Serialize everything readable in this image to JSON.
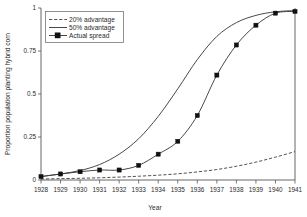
{
  "chart_data": {
    "type": "line",
    "title": "",
    "xlabel": "Year",
    "ylabel": "Proportion population planting hybrid corn",
    "x": [
      1928,
      1929,
      1930,
      1931,
      1932,
      1933,
      1934,
      1935,
      1936,
      1937,
      1938,
      1939,
      1940,
      1941
    ],
    "xlim": [
      1928,
      1941
    ],
    "ylim": [
      0,
      1
    ],
    "xticks": [
      "1928",
      "1929",
      "1930",
      "1931",
      "1932",
      "1933",
      "1934",
      "1935",
      "1936",
      "1937",
      "1938",
      "1939",
      "1940",
      "1941"
    ],
    "yticks": [
      "0",
      "0.25",
      "0.5",
      "0.75",
      "1"
    ],
    "ytick_values": [
      0,
      0.25,
      0.5,
      0.75,
      1
    ],
    "grid": false,
    "legend_position": "top-left",
    "series": [
      {
        "name": "20% advantage",
        "style": "dashed",
        "marker": "none",
        "color": "#333333",
        "values": [
          0.006,
          0.008,
          0.01,
          0.013,
          0.017,
          0.022,
          0.028,
          0.036,
          0.047,
          0.061,
          0.08,
          0.104,
          0.133,
          0.165
        ]
      },
      {
        "name": "50% advantage",
        "style": "solid",
        "marker": "none",
        "color": "#333333",
        "values": [
          0.02,
          0.035,
          0.055,
          0.09,
          0.15,
          0.24,
          0.37,
          0.53,
          0.7,
          0.835,
          0.915,
          0.957,
          0.978,
          0.985
        ]
      },
      {
        "name": "Actual spread",
        "style": "solid",
        "marker": "square",
        "color": "#111111",
        "values": [
          0.02,
          0.035,
          0.048,
          0.058,
          0.058,
          0.085,
          0.15,
          0.225,
          0.375,
          0.61,
          0.785,
          0.9,
          0.97,
          0.98
        ]
      }
    ]
  },
  "legend": {
    "items": [
      {
        "label": "20% advantage"
      },
      {
        "label": "50% advantage"
      },
      {
        "label": "Actual spread"
      }
    ]
  },
  "axes": {
    "x_title": "Year",
    "y_title": "Proportion population planting hybrid corn"
  }
}
